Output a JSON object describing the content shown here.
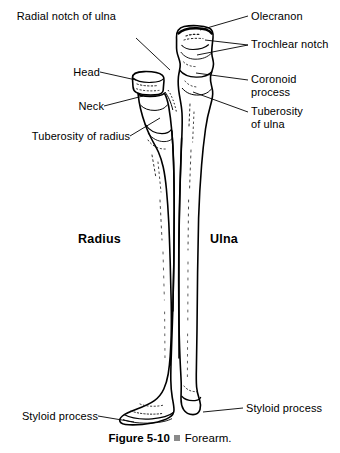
{
  "figure": {
    "caption_number": "Figure 5-10",
    "caption_bullet": "square-bullet-icon",
    "caption_title": "Forearm."
  },
  "bone_names": [
    {
      "id": "radius",
      "label": "Radius",
      "x": 78,
      "y": 232
    },
    {
      "id": "ulna",
      "label": "Ulna",
      "x": 210,
      "y": 232
    }
  ],
  "labels": [
    {
      "id": "olecranon",
      "lines": [
        "Olecranon"
      ],
      "side": "right",
      "x": 251,
      "y": 10
    },
    {
      "id": "trochlear-notch",
      "lines": [
        "Trochlear notch"
      ],
      "side": "right",
      "x": 251,
      "y": 38
    },
    {
      "id": "coronoid-process",
      "lines": [
        "Coronoid",
        "process"
      ],
      "side": "right",
      "x": 251,
      "y": 73
    },
    {
      "id": "tuberosity-of-ulna",
      "lines": [
        "Tuberosity",
        "of ulna"
      ],
      "side": "right",
      "x": 251,
      "y": 105
    },
    {
      "id": "styloid-process-ulna",
      "lines": [
        "Styloid process"
      ],
      "side": "right",
      "x": 246,
      "y": 402
    },
    {
      "id": "radial-notch-of-ulna",
      "lines": [
        "Radial notch of ulna"
      ],
      "side": "left",
      "x": 16,
      "y": 31
    },
    {
      "id": "head",
      "lines": [
        "Head"
      ],
      "side": "left",
      "x": 64,
      "y": 66
    },
    {
      "id": "neck",
      "lines": [
        "Neck"
      ],
      "side": "left",
      "x": 68,
      "y": 100
    },
    {
      "id": "tuberosity-of-radius",
      "lines": [
        "Tuberosity of radius"
      ],
      "side": "left",
      "x": 14,
      "y": 130
    },
    {
      "id": "styloid-process-radius",
      "lines": [
        "Styloid process"
      ],
      "side": "left",
      "x": 10,
      "y": 410
    }
  ],
  "colors": {
    "ink": "#000000",
    "background": "#ffffff",
    "bullet": "#8a8a8a",
    "shading": "#2b2b2b"
  }
}
